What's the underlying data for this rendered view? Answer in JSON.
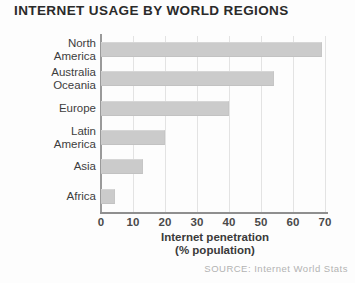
{
  "title": "INTERNET USAGE BY WORLD\nREGIONS",
  "source": "SOURCE: Internet World Stats",
  "axis_title": "Internet penetration\n(% population)",
  "colors": {
    "bar_fill": "#cbcbcb",
    "gridline": "#e3e3e3",
    "axis": "#8f8f8f",
    "title_text": "#2a2a2a",
    "source_text": "#b3b3b3"
  },
  "chart_data": {
    "type": "bar",
    "orientation": "horizontal",
    "title": "INTERNET USAGE BY WORLD REGIONS",
    "xlabel": "Internet penetration (% population)",
    "ylabel": "",
    "xlim": [
      0,
      70
    ],
    "xticks": [
      0,
      10,
      20,
      30,
      40,
      50,
      60,
      70
    ],
    "xtick_labels": [
      "0",
      "10",
      "20",
      "30",
      "40",
      "50",
      "60",
      "70"
    ],
    "grid": true,
    "legend": false,
    "source": "SOURCE: Internet World Stats",
    "categories": [
      "North\nAmerica",
      "Australia\nOceania",
      "Europe",
      "Latin\nAmerica",
      "Asia",
      "Africa"
    ],
    "values": [
      69,
      54,
      40,
      20,
      13,
      4.5
    ]
  }
}
